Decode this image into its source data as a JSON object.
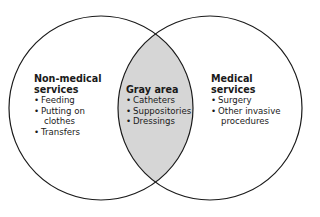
{
  "diagram": {
    "type": "venn",
    "colors": {
      "outline": "#1a1a1a",
      "overlap_fill": "#d6d6d6",
      "background": "#ffffff"
    },
    "left": {
      "title_line1": "Non-medical",
      "title_line2": "services",
      "items": [
        "Feeding",
        "Putting on",
        "clothes",
        "Transfers"
      ]
    },
    "overlap": {
      "title": "Gray area",
      "items": [
        "Catheters",
        "Suppositories",
        "Dressings"
      ]
    },
    "right": {
      "title_line1": "Medical",
      "title_line2": "services",
      "items": [
        "Surgery",
        "Other invasive",
        "procedures"
      ]
    }
  }
}
